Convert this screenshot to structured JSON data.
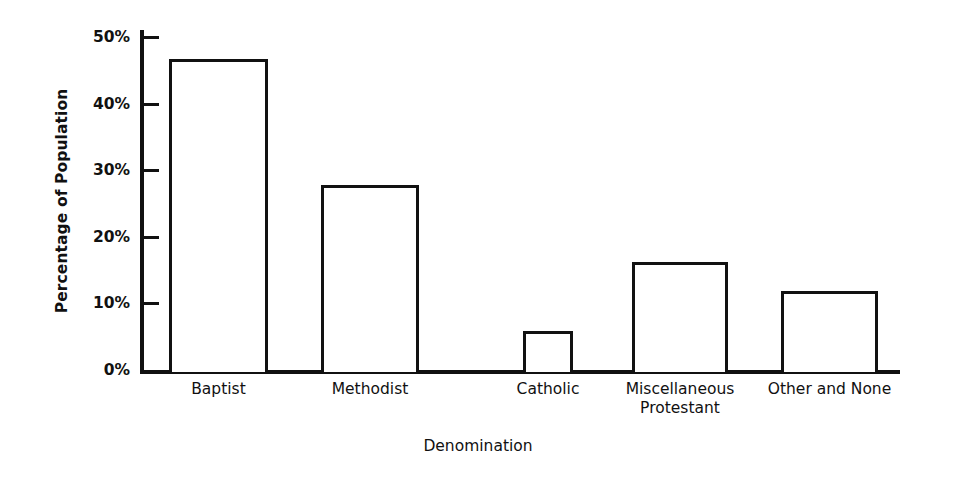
{
  "chart_data": {
    "type": "bar",
    "title": "",
    "xlabel": "Denomination",
    "ylabel": "Percentage of Population",
    "categories": [
      "Baptist",
      "Methodist",
      "Catholic",
      "Miscellaneous\nProtestant",
      "Other and None"
    ],
    "values": [
      46.7,
      27.8,
      5.9,
      16.2,
      11.8
    ],
    "ylim": [
      0,
      50
    ],
    "yticks": [
      0,
      10,
      20,
      30,
      40,
      50
    ],
    "ytick_labels": [
      "0%",
      "10%",
      "20%",
      "30%",
      "40%",
      "50%"
    ],
    "grid": false,
    "legend": "none",
    "bar_fill": "#ffffff",
    "bar_edge": "#111111",
    "axis_color": "#111111",
    "background": "#ffffff"
  }
}
